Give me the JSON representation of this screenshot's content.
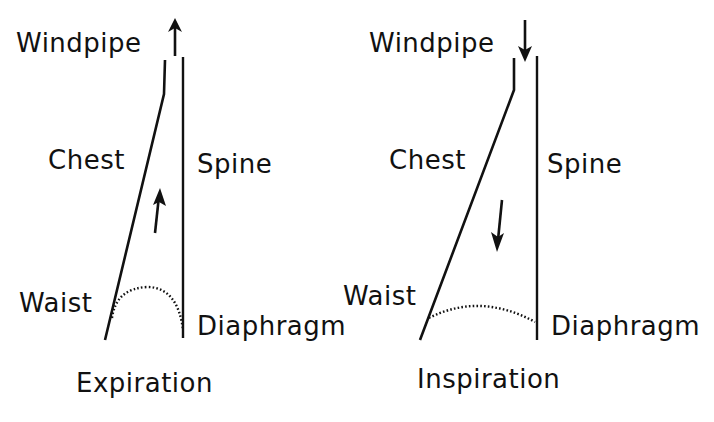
{
  "diagrams": [
    {
      "caption": "Expiration",
      "labels": {
        "windpipe": "Windpipe",
        "chest": "Chest",
        "spine": "Spine",
        "waist": "Waist",
        "diaphragm": "Diaphragm"
      },
      "windpipe_arrow": "up",
      "internal_arrow": "up"
    },
    {
      "caption": "Inspiration",
      "labels": {
        "windpipe": "Windpipe",
        "chest": "Chest",
        "spine": "Spine",
        "waist": "Waist",
        "diaphragm": "Diaphragm"
      },
      "windpipe_arrow": "down",
      "internal_arrow": "down"
    }
  ],
  "colors": {
    "ink": "#111111",
    "background": "#ffffff"
  }
}
